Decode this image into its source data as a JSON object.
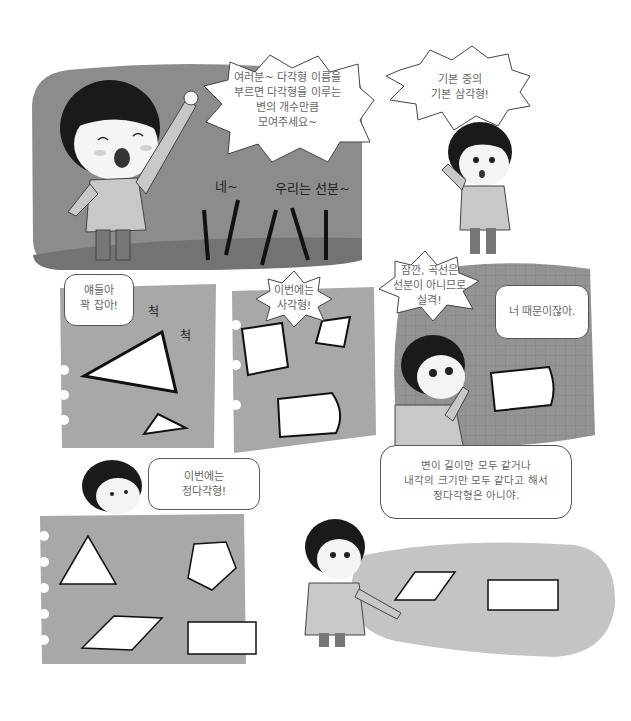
{
  "page": {
    "colors": {
      "dark_panel": "#8c8c8c",
      "ground": "#737373",
      "paper": "#a8a8a8",
      "grid_panel": "#939393",
      "grass": "#c4c4c4",
      "bubble": "#ffffff",
      "ink": "#1a1a1a"
    }
  },
  "panels": [
    {
      "id": "panel-1",
      "bubble_text": "여러분~ 다각형 이름을\n부르면 다각형을 이루는\n변의 개수만큼\n모여주세요~",
      "sfx": [
        "네~",
        "우리는 선분~"
      ]
    },
    {
      "id": "panel-2",
      "bubble_text": "기본 중의\n기본 삼각형!"
    },
    {
      "id": "panel-3",
      "bubble_text": "얘들아\n꽉 잡아!",
      "sfx": [
        "척",
        "척"
      ]
    },
    {
      "id": "panel-4",
      "bubble_text": "이번에는\n사각형!"
    },
    {
      "id": "panel-5",
      "bubble_text_1": "잠깐, 곡선은\n선분이 아니므로\n실격!",
      "bubble_text_2": "너 때문이잖아."
    },
    {
      "id": "panel-6",
      "bubble_text": "이번에는\n정다각형!"
    },
    {
      "id": "panel-7",
      "bubble_text": "변이 길이만 모두 같거나\n내각의 크기만 모두 같다고 해서\n정다각형은 아니야."
    }
  ]
}
